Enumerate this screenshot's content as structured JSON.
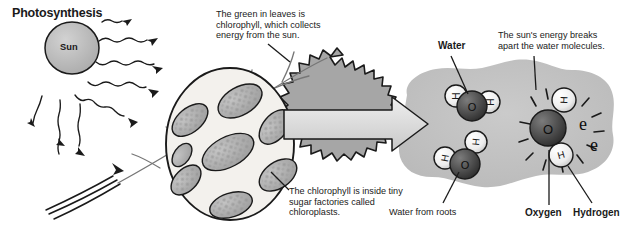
{
  "diagram": {
    "title": "Photosynthesis",
    "sun": {
      "label": "Sun"
    },
    "notes": [
      {
        "id": "note-chlorophyll-collects",
        "text": "The green in leaves is\nchlorophyll, which collects\nenergy from the sun."
      },
      {
        "id": "note-chloroplasts",
        "text": "The chlorophyll is inside tiny\nsugar factories called\nchloroplasts."
      },
      {
        "id": "note-sun-breaks-water",
        "text": "The sun's energy breaks\napart the water molecules."
      }
    ],
    "labels": [
      {
        "id": "label-water",
        "text": "Water",
        "style": "bold"
      },
      {
        "id": "label-water-from-roots",
        "text": "Water from roots",
        "style": "plain"
      },
      {
        "id": "label-oxygen",
        "text": "Oxygen",
        "style": "bold"
      },
      {
        "id": "label-hydrogen",
        "text": "Hydrogen",
        "style": "bold"
      }
    ],
    "molecules": {
      "water_top": {
        "oxygen": "O",
        "hydrogen_left": "H",
        "hydrogen_right": "H"
      },
      "water_bottom": {
        "oxygen": "O",
        "hydrogen_left": "H",
        "hydrogen_top": "H"
      },
      "split": {
        "oxygen": "O",
        "hydrogen_top": "H",
        "hydrogen_bottom": "H",
        "electron_1": "e",
        "electron_2": "e"
      }
    },
    "colors": {
      "ink": "#1a1a1a",
      "leaf": "#a8a8a8",
      "leaf_dark": "#8e8e8e",
      "sun": "#b8b8b8",
      "blob": "#bdbdbd",
      "arrow_fill": "#d8d8d8",
      "oxygen_sphere": "#4a4a4a",
      "hydrogen_sphere": "#ededed",
      "chloroplast": "#b3b3b3",
      "cell_bg": "#f2f0ec"
    }
  }
}
